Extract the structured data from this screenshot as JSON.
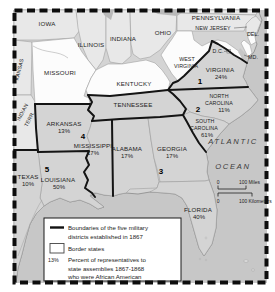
{
  "colors": {
    "ocean": "#c7c7c7",
    "south_fill": "#d4d4d4",
    "north_fill": "#e8e8e8",
    "border_state_fill": "#fcfcfc",
    "lake": "#b9b9b9",
    "boundary": "#141414"
  },
  "states": {
    "iowa": {
      "name": "IOWA"
    },
    "illinois": {
      "name": "ILLINOIS"
    },
    "indiana": {
      "name": "INDIANA"
    },
    "ohio": {
      "name": "OHIO"
    },
    "pennsylvania": {
      "name": "PENNSYLVANIA"
    },
    "new_jersey": {
      "name": "NEW JERSEY"
    },
    "delaware": {
      "name": "DEL."
    },
    "maryland": {
      "name": "MD."
    },
    "dc": {
      "name": "D.C."
    },
    "west_virginia": {
      "line1": "WEST",
      "line2": "VIRGINIA"
    },
    "virginia": {
      "name": "VIRGINIA",
      "pct": "24%"
    },
    "kentucky": {
      "name": "KENTUCKY"
    },
    "missouri": {
      "name": "MISSOURI"
    },
    "kansas": {
      "name": "KANSAS"
    },
    "indian_territory": {
      "line1": "INDIAN",
      "line2": "TERR."
    },
    "tennessee": {
      "name": "TENNESSEE"
    },
    "north_carolina": {
      "line1": "NORTH",
      "line2": "CAROLINA",
      "pct": "11%"
    },
    "south_carolina": {
      "line1": "SOUTH",
      "line2": "CAROLINA",
      "pct": "61%"
    },
    "arkansas": {
      "name": "ARKANSAS",
      "pct": "13%"
    },
    "mississippi": {
      "name": "MISSISSIPPI",
      "pct": "17%"
    },
    "alabama": {
      "name": "ALABAMA",
      "pct": "17%"
    },
    "georgia": {
      "name": "GEORGIA",
      "pct": "17%"
    },
    "florida": {
      "name": "FLORIDA",
      "pct": "40%"
    },
    "louisiana": {
      "name": "LOUISIANA",
      "pct": "50%"
    },
    "texas": {
      "name": "TEXAS",
      "pct": "10%"
    }
  },
  "districts": {
    "d1": "1",
    "d2": "2",
    "d3": "3",
    "d4": "4",
    "d5": "5"
  },
  "ocean": {
    "line1": "ATLANTIC",
    "line2": "OCEAN"
  },
  "scale_bar": {
    "miles_zero": "0",
    "miles_label": "100 Miles",
    "km_zero": "0",
    "km_label": "100 Kilometers"
  },
  "legend": {
    "boundaries_line1": "Boundaries of the five military",
    "boundaries_line2": "districts established in 1867",
    "border_states": "Border states",
    "pct_sample": "13%",
    "pct_line1": "Percent of representatives to",
    "pct_line2": "state assemblies 1867-1868",
    "pct_line3": "who were African American"
  }
}
